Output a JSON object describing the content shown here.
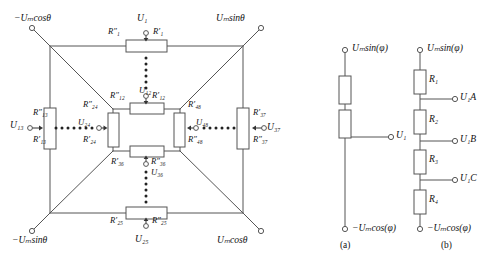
{
  "figure": {
    "panel_a_caption": "(a)",
    "panel_b_caption": "(b)"
  },
  "main_network": {
    "corners": {
      "top_left": "−Uₘcosθ",
      "top_right": "Uₘsinθ",
      "bottom_left": "−Uₘsinθ",
      "bottom_right": "Uₘcosθ"
    },
    "outer_taps": {
      "top": {
        "node": "U₁",
        "left_resistor": "R″₁",
        "right_resistor": "R′₁"
      },
      "bottom": {
        "node": "U₂₅",
        "left_resistor": "R′₂₅",
        "right_resistor": "R″₂₅"
      },
      "left": {
        "node": "U₁₃",
        "top_resistor": "R″₁₃",
        "bottom_resistor": "R′₁₃"
      },
      "right": {
        "node": "U₃₇",
        "top_resistor": "R′₃₇",
        "bottom_resistor": "R″₃₇"
      }
    },
    "inner_taps": {
      "top": {
        "node": "U₁₂",
        "left_resistor": "R″₁₂",
        "right_resistor": "R′₁₂"
      },
      "bottom": {
        "node": "U₃₆",
        "left_resistor": "R′₃₆",
        "right_resistor": "R″₃₆"
      },
      "left": {
        "node": "U₂₄",
        "top_resistor": "R″₂₄",
        "bottom_resistor": "R′₂₄"
      },
      "right": {
        "node": "U₄₈",
        "top_resistor": "R′₄₈",
        "bottom_resistor": "R″₄₈"
      }
    }
  },
  "panel_a": {
    "top_terminal": "Uₘsin(φ)",
    "bottom_terminal": "−Uₘcos(φ)",
    "tap": "U₁",
    "resistor_count": 2
  },
  "panel_b": {
    "top_terminal": "Uₘsin(φ)",
    "bottom_terminal": "−Uₘcos(φ)",
    "resistors": [
      "R₁",
      "R₂",
      "R₃",
      "R₄"
    ],
    "taps": [
      "U₁A",
      "U₁B",
      "U₁C"
    ]
  },
  "colors": {
    "line": "#4a4a4a",
    "resistor_fill": "#ffffff",
    "text": "#111111"
  }
}
